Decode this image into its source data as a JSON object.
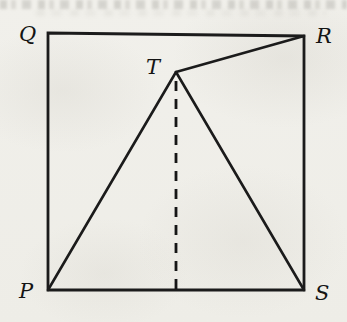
{
  "figure": {
    "description_labels": {
      "top_left": "Q",
      "top_right": "R",
      "apex": "T",
      "bottom_left": "P",
      "bottom_right": "S"
    },
    "vertices": {
      "Q": [
        48,
        33
      ],
      "R": [
        304,
        36
      ],
      "S": [
        304,
        290
      ],
      "P": [
        48,
        290
      ],
      "T": [
        176,
        72
      ]
    },
    "segments": [
      {
        "from": "Q",
        "to": "R",
        "style": "solid"
      },
      {
        "from": "R",
        "to": "S",
        "style": "solid"
      },
      {
        "from": "S",
        "to": "P",
        "style": "solid"
      },
      {
        "from": "P",
        "to": "Q",
        "style": "solid"
      },
      {
        "from": "P",
        "to": "T",
        "style": "solid"
      },
      {
        "from": "T",
        "to": "R",
        "style": "solid"
      },
      {
        "from": "T",
        "to": "S",
        "style": "solid"
      },
      {
        "from": "T",
        "to": "foot-on-PS",
        "style": "dashed"
      }
    ]
  },
  "colors": {
    "paper": "#f0efea",
    "ink": "#1b1b1b"
  }
}
